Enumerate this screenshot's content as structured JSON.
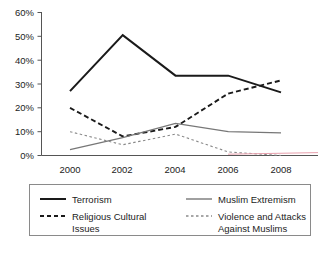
{
  "chart_data": {
    "type": "line",
    "title": "",
    "subtitle": "",
    "xlabel": "",
    "ylabel": "",
    "x": [
      "2000",
      "2002",
      "2004",
      "2006",
      "2008"
    ],
    "categories": [
      "2000",
      "2002",
      "2004",
      "2006",
      "2008"
    ],
    "ylim": [
      0,
      60
    ],
    "y_tick_labels": [
      "0%",
      "10%",
      "20%",
      "30%",
      "40%",
      "50%",
      "60%"
    ],
    "y_tick_values": [
      0,
      10,
      20,
      30,
      40,
      50,
      60
    ],
    "x_tick_labels": [
      "2000",
      "2002",
      "2004",
      "2006",
      "2008"
    ],
    "grid": false,
    "legend_position": "bottom",
    "series": [
      {
        "name": "Terrorism",
        "values": [
          27,
          50.5,
          33.5,
          33.5,
          26.5
        ],
        "color": "#1a1a1a",
        "style": "solid",
        "width": 2.0
      },
      {
        "name": "Religious Cultural Issues",
        "values": [
          20,
          8,
          12,
          26,
          31.5
        ],
        "color": "#1a1a1a",
        "style": "dashed",
        "width": 1.9
      },
      {
        "name": "Muslim Extremism",
        "values": [
          2.5,
          7.5,
          13.5,
          10,
          9.5
        ],
        "color": "#777777",
        "style": "solid",
        "width": 1.3
      },
      {
        "name": "Violence and Attacks Against Muslims",
        "values": [
          10,
          4.5,
          9,
          1.5,
          0
        ],
        "color": "#8a8a8a",
        "style": "dotted",
        "width": 1.1
      }
    ]
  },
  "axes": {
    "y_labels": [
      {
        "text": "60%",
        "value": 60
      },
      {
        "text": "50%",
        "value": 50
      },
      {
        "text": "40%",
        "value": 40
      },
      {
        "text": "30%",
        "value": 30
      },
      {
        "text": "20%",
        "value": 20
      },
      {
        "text": "10%",
        "value": 10
      },
      {
        "text": "0%",
        "value": 0
      }
    ],
    "x_labels": [
      {
        "text": "2000"
      },
      {
        "text": "2002"
      },
      {
        "text": "2004"
      },
      {
        "text": "2006"
      },
      {
        "text": "2008"
      }
    ]
  },
  "legend": {
    "entries": [
      {
        "label": "Terrorism",
        "swatch": "solid-dark-line-icon"
      },
      {
        "label": "Muslim Extremism",
        "swatch": "solid-gray-line-icon"
      },
      {
        "label": "Religious Cultural",
        "label_line2": "Issues",
        "swatch": "dashed-dark-line-icon"
      },
      {
        "label": "Violence and Attacks",
        "label_line2": "Against Muslims",
        "swatch": "dotted-gray-line-icon"
      }
    ]
  },
  "colors": {
    "terrorism": "#1a1a1a",
    "religious": "#1a1a1a",
    "extremism": "#777777",
    "violence": "#8a8a8a",
    "axis": "#555555",
    "legend_border": "#8a8a8a",
    "background": "#ffffff"
  }
}
